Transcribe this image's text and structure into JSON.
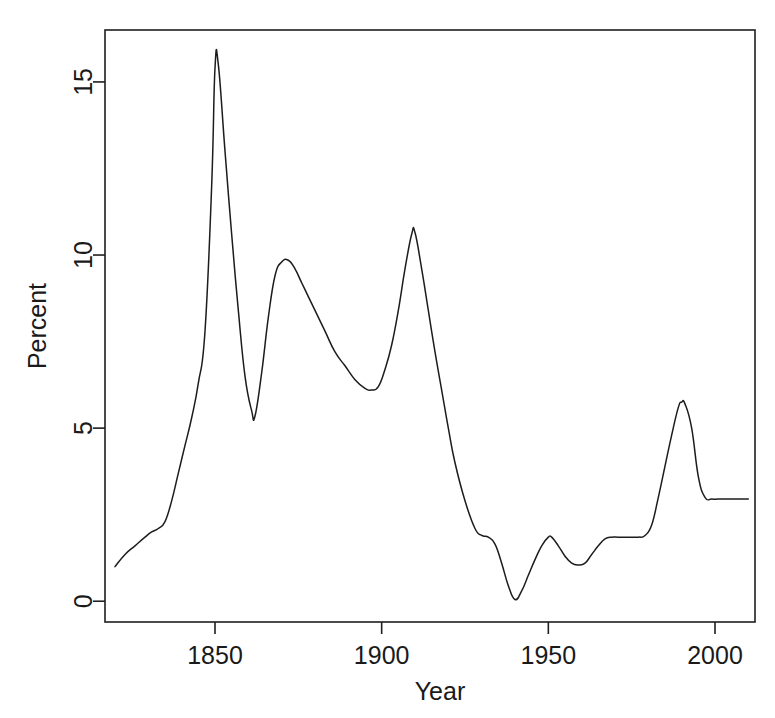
{
  "chart_data": {
    "type": "line",
    "title": "",
    "subtitle": "",
    "xlabel": "Year",
    "ylabel": "Percent",
    "xlim": [
      1817,
      2012
    ],
    "ylim": [
      -0.6,
      16.5
    ],
    "xticks": [
      1850,
      1900,
      1950,
      2000
    ],
    "xtick_labels": [
      "1850",
      "1900",
      "1950",
      "2000"
    ],
    "yticks": [
      0,
      5,
      10,
      15
    ],
    "ytick_labels": [
      "0",
      "5",
      "10",
      "15"
    ],
    "grid": false,
    "legend": false,
    "legend_position": "none",
    "line_color": "#1c1c1c",
    "background_color": "#ffffff",
    "series": [
      {
        "name": "Percent",
        "x": [
          1820,
          1823,
          1826,
          1829,
          1831,
          1833,
          1835,
          1837,
          1839,
          1841,
          1843,
          1845,
          1847,
          1849,
          1850,
          1851,
          1853,
          1855,
          1857,
          1859,
          1861,
          1862,
          1864,
          1866,
          1868,
          1870,
          1872,
          1874,
          1876,
          1878,
          1880,
          1883,
          1886,
          1889,
          1892,
          1895,
          1897,
          1899,
          1901,
          1903,
          1905,
          1907,
          1909,
          1910,
          1912,
          1914,
          1916,
          1918,
          1920,
          1922,
          1925,
          1928,
          1930,
          1932,
          1934,
          1936,
          1938,
          1940,
          1942,
          1944,
          1946,
          1948,
          1950,
          1951,
          1953,
          1955,
          1957,
          1959,
          1961,
          1963,
          1965,
          1967,
          1969,
          1971,
          1974,
          1977,
          1979,
          1981,
          1983,
          1985,
          1987,
          1989,
          1990,
          1991,
          1993,
          1995,
          1997,
          1999,
          2001,
          2004,
          2007,
          2010
        ],
        "y": [
          1.0,
          1.35,
          1.6,
          1.85,
          2.0,
          2.1,
          2.3,
          2.9,
          3.7,
          4.5,
          5.3,
          6.3,
          7.8,
          12.0,
          15.4,
          15.5,
          13.0,
          10.6,
          8.4,
          6.5,
          5.5,
          5.35,
          6.6,
          8.2,
          9.4,
          9.8,
          9.85,
          9.6,
          9.2,
          8.8,
          8.4,
          7.8,
          7.2,
          6.8,
          6.4,
          6.15,
          6.1,
          6.2,
          6.7,
          7.4,
          8.4,
          9.6,
          10.6,
          10.65,
          9.6,
          8.4,
          7.2,
          6.1,
          5.0,
          4.0,
          2.9,
          2.1,
          1.9,
          1.85,
          1.65,
          1.1,
          0.45,
          0.05,
          0.3,
          0.75,
          1.2,
          1.6,
          1.85,
          1.85,
          1.6,
          1.3,
          1.1,
          1.05,
          1.1,
          1.35,
          1.6,
          1.8,
          1.85,
          1.85,
          1.85,
          1.85,
          1.9,
          2.2,
          3.0,
          3.9,
          4.8,
          5.6,
          5.75,
          5.7,
          5.0,
          3.6,
          3.0,
          2.95,
          2.95,
          2.95,
          2.95,
          2.95
        ]
      }
    ]
  },
  "axes": {
    "y_title": "Percent",
    "x_title": "Year"
  }
}
